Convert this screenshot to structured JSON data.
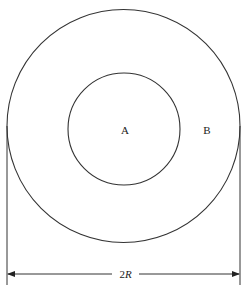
{
  "diagram": {
    "type": "concentric-circles",
    "outer_circle": {
      "cx": 123.5,
      "cy": 126,
      "r": 116.5,
      "stroke": "#333333"
    },
    "inner_circle": {
      "cx": 124,
      "cy": 129,
      "r": 56,
      "stroke": "#333333"
    },
    "labels": {
      "inner_region": "A",
      "outer_region": "B"
    },
    "dimension": {
      "prefix": "2",
      "variable": "R",
      "y": 274,
      "x_left": 7,
      "x_right": 240
    },
    "caption_faint": ""
  }
}
